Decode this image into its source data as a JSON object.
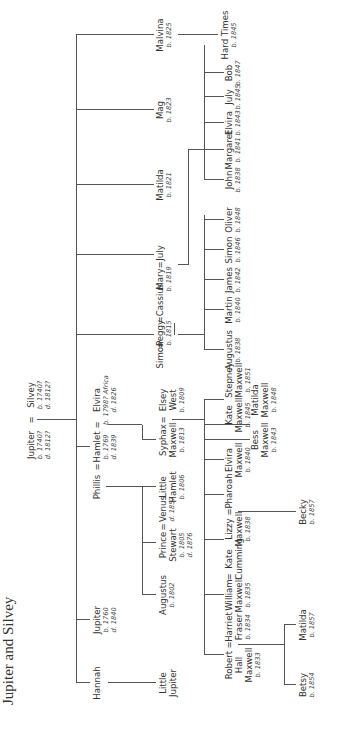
{
  "title": "Jupiter and Silvey",
  "equals": "=",
  "root": {
    "left": {
      "name": "Jupiter",
      "born": "b. 1740?",
      "died": "d. 1812?"
    },
    "right": {
      "name": "Silvey",
      "born": "b. 1740?",
      "died": "d. 1812?"
    }
  },
  "gen1": {
    "hannah": {
      "name": "Hannah"
    },
    "jupiter": {
      "name": "Jupiter",
      "born": "b. 1760",
      "died": "d. 1840"
    },
    "phillis": {
      "name": "Phillis"
    },
    "hamlet": {
      "name": "Hamlet",
      "born": "b. 1769",
      "died": "d. 1839"
    },
    "elvira": {
      "name": "Elvira",
      "born": "b. 1798? Africa",
      "died": "d. 1826"
    },
    "simon": {
      "name": "Simon"
    },
    "peggy": {
      "name": "Peggy",
      "born": "b. 1815"
    },
    "cassius": {
      "name": "Cassius"
    },
    "mary": {
      "name": "Mary",
      "born": "b. 1819"
    },
    "july": {
      "name": "July"
    },
    "matilda": {
      "name": "Matilda",
      "born": "b. 1821"
    },
    "mag": {
      "name": "Mag",
      "born": "b. 1823"
    },
    "malvina": {
      "name": "Malvina",
      "born": "b. 1825"
    }
  },
  "gen2": {
    "little_jupiter": {
      "name1": "Little",
      "name2": "Jupiter"
    },
    "augustus": {
      "name": "Augustus",
      "born": "b. 1802"
    },
    "prince": {
      "name1": "Prince",
      "name2": "Stewart",
      "born": "b. 1805",
      "died": "d. 1876"
    },
    "venus": {
      "name": "Venus",
      "died": "d. 1857"
    },
    "little_hamlet": {
      "name1": "Little",
      "name2": "Hamlet",
      "born": "b. 1806"
    },
    "syphax": {
      "name1": "Syphax",
      "name2": "Maxwell",
      "born": "b. 1813"
    },
    "elsey": {
      "name1": "Elsey",
      "name2": "West",
      "born": "b. 1809"
    },
    "hard_times": {
      "name": "Hard Times",
      "born": "b. 1845"
    }
  },
  "gen3": {
    "robert": {
      "name1": "Robert",
      "name2": "Hall",
      "name3": "Maxwell",
      "born": "b. 1833"
    },
    "harriet": {
      "name1": "Harriet",
      "name2": "Fraser",
      "born": "b. 1834"
    },
    "william": {
      "name1": "William",
      "name2": "Maxwell",
      "born": "b. 1835"
    },
    "kate_cumming": {
      "name1": "Kate",
      "name2": "Cumming"
    },
    "lizzy": {
      "name1": "Lizzy",
      "name2": "Maxwell",
      "born": "b. 1838"
    },
    "pharoah": {
      "name": "Pharoah"
    },
    "elvira_m": {
      "name1": "Elvira",
      "name2": "Maxwell",
      "born": "b. 1840"
    },
    "bess": {
      "name1": "Bess",
      "name2": "Maxwell",
      "born": "b. 1843"
    },
    "kate_m": {
      "name1": "Kate",
      "name2": "Maxwell",
      "born": "b. 1845"
    },
    "matilda_m": {
      "name1": "Matilda",
      "name2": "Maxwell",
      "born": "b. 1848"
    },
    "stepney": {
      "name1": "Stepney",
      "name2": "Maxwell",
      "born": "b. 1851"
    },
    "augustus": {
      "name": "Augustus",
      "born": "b. 1838"
    },
    "martin": {
      "name": "Martin",
      "born": "b. 1840"
    },
    "james": {
      "name": "James",
      "born": "b. 1842"
    },
    "simon": {
      "name": "Simon",
      "born": "b. 1846"
    },
    "oliver": {
      "name": "Oliver",
      "born": "b. 1848"
    },
    "john": {
      "name": "John",
      "born": "b. 1838"
    },
    "margaret": {
      "name": "Margaret",
      "born": "b. 1841"
    },
    "elvira": {
      "name": "Elvira",
      "born": "b. 1843"
    },
    "july": {
      "name": "July",
      "born": "b. 1845"
    },
    "bob": {
      "name": "Bob",
      "born": "b. 1847"
    }
  },
  "gen4": {
    "betsy": {
      "name": "Betsy",
      "born": "b. 1854"
    },
    "matilda": {
      "name": "Matilda",
      "born": "b. 1857"
    },
    "becky": {
      "name": "Becky",
      "born": "b. 1857"
    }
  }
}
